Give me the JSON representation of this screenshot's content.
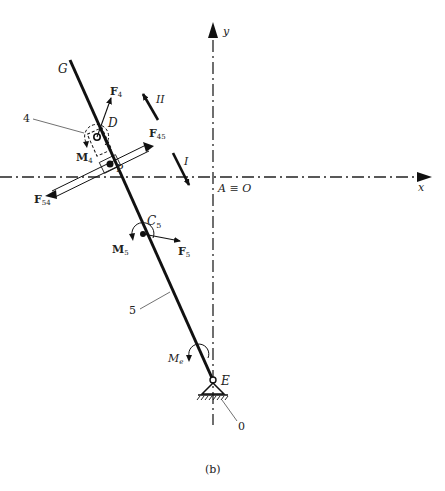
{
  "figure": {
    "caption": "(b)",
    "axes": {
      "x_label": "x",
      "y_label": "y",
      "origin_label": "A ≡ O"
    },
    "points": {
      "G": "G",
      "D": "D",
      "P": "P",
      "C5": {
        "base": "C",
        "sub": "5"
      },
      "E": "E"
    },
    "bodies": {
      "slider": "4",
      "link": "5",
      "ground": "0"
    },
    "forces": {
      "F4": {
        "base": "F",
        "sub": "4"
      },
      "F45": {
        "base": "F",
        "sub": "45"
      },
      "F54": {
        "base": "F",
        "sub": "54"
      },
      "F5": {
        "base": "F",
        "sub": "5"
      }
    },
    "moments": {
      "M4": {
        "base": "M",
        "sub": "4"
      },
      "M5": {
        "base": "M",
        "sub": "5"
      },
      "Me": {
        "base": "M",
        "sub": "e"
      }
    },
    "directions": {
      "I": "I",
      "II": "II"
    }
  }
}
